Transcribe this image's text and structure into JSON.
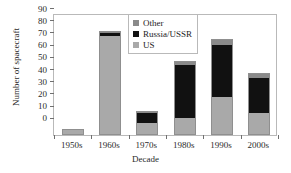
{
  "chart_data": {
    "type": "bar",
    "subtype": "stacked-bar",
    "title": "",
    "xlabel": "Decade",
    "ylabel": "Number of spacecraft",
    "categories": [
      "1950s",
      "1960s",
      "1970s",
      "1980s",
      "1990s",
      "2000s"
    ],
    "series": [
      {
        "name": "US",
        "color": "#a9a9a9",
        "values": [
          5,
          81,
          10,
          14,
          31,
          18
        ]
      },
      {
        "name": "Russia/USSR",
        "color": "#111111",
        "values": [
          0,
          3,
          8,
          43,
          43,
          29
        ]
      },
      {
        "name": "Other",
        "color": "#8a8a8a",
        "values": [
          0,
          1,
          2,
          4,
          5,
          4
        ]
      }
    ],
    "totals": [
      5,
      85,
      20,
      61,
      79,
      51
    ],
    "ylim": [
      0,
      100
    ],
    "yticks": [
      0,
      10,
      20,
      30,
      40,
      50,
      60,
      70,
      80,
      90,
      100
    ],
    "grid": false,
    "legend_position": "top-center",
    "stack_order": [
      "US",
      "Russia/USSR",
      "Other"
    ]
  },
  "legend": {
    "entries": [
      {
        "label": "Other",
        "swatch": "other"
      },
      {
        "label": "Russia/USSR",
        "swatch": "ru"
      },
      {
        "label": "US",
        "swatch": "us"
      }
    ]
  }
}
